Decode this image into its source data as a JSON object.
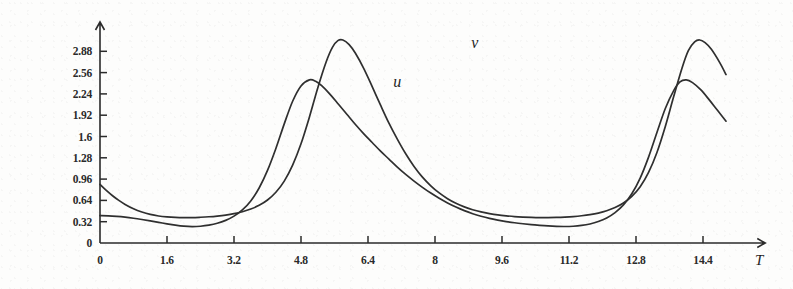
{
  "chart_data": {
    "type": "line",
    "title": "",
    "subtitle": "",
    "xlabel": "T",
    "ylabel": "",
    "xlim": [
      0,
      15.6
    ],
    "ylim": [
      0,
      3.2
    ],
    "grid": false,
    "legend_position": "inline-annotation",
    "x_ticks": [
      "0",
      "1.6",
      "3.2",
      "4.8",
      "6.4",
      "8",
      "9.6",
      "11.2",
      "12.8",
      "14.4"
    ],
    "x_tick_values": [
      0,
      1.6,
      3.2,
      4.8,
      6.4,
      8,
      9.6,
      11.2,
      12.8,
      14.4
    ],
    "y_ticks": [
      "0",
      "0.32",
      "0.64",
      "0.96",
      "1.28",
      "1.6",
      "1.92",
      "2.24",
      "2.56",
      "2.88"
    ],
    "y_tick_values": [
      0,
      0.32,
      0.64,
      0.96,
      1.28,
      1.6,
      1.92,
      2.24,
      2.56,
      2.88
    ],
    "annotations": [
      {
        "text": "u",
        "x": 7.1,
        "y": 2.34
      },
      {
        "text": "v",
        "x": 8.95,
        "y": 2.93
      }
    ],
    "series": [
      {
        "name": "u",
        "color": "#2f2f2f",
        "period": 4.72,
        "peak_value": 2.45,
        "trough_value": 0.25,
        "initial_value": 0.41,
        "peak_times": [
          2.85,
          7.57,
          12.29
        ],
        "points": [
          [
            0.0,
            0.41
          ],
          [
            0.2,
            0.408
          ],
          [
            0.4,
            0.4
          ],
          [
            0.6,
            0.388
          ],
          [
            0.8,
            0.372
          ],
          [
            1.0,
            0.353
          ],
          [
            1.2,
            0.332
          ],
          [
            1.4,
            0.31
          ],
          [
            1.6,
            0.288
          ],
          [
            1.8,
            0.268
          ],
          [
            2.0,
            0.253
          ],
          [
            2.2,
            0.247
          ],
          [
            2.4,
            0.252
          ],
          [
            2.6,
            0.268
          ],
          [
            2.8,
            0.296
          ],
          [
            3.0,
            0.34
          ],
          [
            3.2,
            0.404
          ],
          [
            3.4,
            0.497
          ],
          [
            3.6,
            0.632
          ],
          [
            3.8,
            0.826
          ],
          [
            4.0,
            1.09
          ],
          [
            4.2,
            1.42
          ],
          [
            4.4,
            1.79
          ],
          [
            4.6,
            2.13
          ],
          [
            4.8,
            2.36
          ],
          [
            5.0,
            2.45
          ],
          [
            5.15,
            2.43
          ],
          [
            5.3,
            2.36
          ],
          [
            5.5,
            2.23
          ],
          [
            5.7,
            2.08
          ],
          [
            5.9,
            1.93
          ],
          [
            6.1,
            1.78
          ],
          [
            6.3,
            1.64
          ],
          [
            6.5,
            1.51
          ],
          [
            6.7,
            1.38
          ],
          [
            6.9,
            1.26
          ],
          [
            7.1,
            1.14
          ],
          [
            7.3,
            1.03
          ],
          [
            7.5,
            0.93
          ],
          [
            7.7,
            0.836
          ],
          [
            7.9,
            0.75
          ],
          [
            8.1,
            0.672
          ],
          [
            8.3,
            0.602
          ],
          [
            8.5,
            0.54
          ],
          [
            8.7,
            0.486
          ],
          [
            8.9,
            0.44
          ],
          [
            9.1,
            0.402
          ],
          [
            9.3,
            0.37
          ],
          [
            9.5,
            0.344
          ],
          [
            9.7,
            0.322
          ],
          [
            9.9,
            0.304
          ],
          [
            10.1,
            0.289
          ],
          [
            10.3,
            0.276
          ],
          [
            10.5,
            0.265
          ],
          [
            10.7,
            0.256
          ],
          [
            10.9,
            0.25
          ],
          [
            11.1,
            0.248
          ],
          [
            11.3,
            0.252
          ],
          [
            11.5,
            0.264
          ],
          [
            11.7,
            0.286
          ],
          [
            11.9,
            0.322
          ],
          [
            12.1,
            0.376
          ],
          [
            12.3,
            0.456
          ],
          [
            12.5,
            0.572
          ],
          [
            12.7,
            0.74
          ],
          [
            12.9,
            0.975
          ],
          [
            13.1,
            1.29
          ],
          [
            13.3,
            1.66
          ],
          [
            13.5,
            2.02
          ],
          [
            13.7,
            2.29
          ],
          [
            13.85,
            2.42
          ],
          [
            14.0,
            2.45
          ],
          [
            14.15,
            2.41
          ],
          [
            14.35,
            2.3
          ],
          [
            14.55,
            2.15
          ],
          [
            14.75,
            1.99
          ],
          [
            14.95,
            1.83
          ]
        ]
      },
      {
        "name": "v",
        "color": "#2f2f2f",
        "period": 4.72,
        "peak_value": 3.05,
        "trough_value": 0.38,
        "initial_value": 0.88,
        "peak_times": [
          3.52,
          8.24,
          12.96
        ],
        "points": [
          [
            0.0,
            0.88
          ],
          [
            0.15,
            0.79
          ],
          [
            0.3,
            0.71
          ],
          [
            0.45,
            0.64
          ],
          [
            0.6,
            0.58
          ],
          [
            0.8,
            0.515
          ],
          [
            1.0,
            0.466
          ],
          [
            1.2,
            0.43
          ],
          [
            1.4,
            0.406
          ],
          [
            1.6,
            0.392
          ],
          [
            1.8,
            0.384
          ],
          [
            2.0,
            0.381
          ],
          [
            2.2,
            0.382
          ],
          [
            2.4,
            0.387
          ],
          [
            2.6,
            0.394
          ],
          [
            2.8,
            0.405
          ],
          [
            3.0,
            0.42
          ],
          [
            3.2,
            0.441
          ],
          [
            3.4,
            0.47
          ],
          [
            3.6,
            0.51
          ],
          [
            3.8,
            0.566
          ],
          [
            4.0,
            0.646
          ],
          [
            4.2,
            0.762
          ],
          [
            4.4,
            0.93
          ],
          [
            4.6,
            1.17
          ],
          [
            4.8,
            1.49
          ],
          [
            5.0,
            1.89
          ],
          [
            5.2,
            2.33
          ],
          [
            5.4,
            2.72
          ],
          [
            5.55,
            2.94
          ],
          [
            5.68,
            3.04
          ],
          [
            5.8,
            3.05
          ],
          [
            5.95,
            2.98
          ],
          [
            6.1,
            2.85
          ],
          [
            6.3,
            2.62
          ],
          [
            6.5,
            2.35
          ],
          [
            6.7,
            2.07
          ],
          [
            6.9,
            1.8
          ],
          [
            7.1,
            1.56
          ],
          [
            7.3,
            1.34
          ],
          [
            7.5,
            1.15
          ],
          [
            7.7,
            0.99
          ],
          [
            7.9,
            0.86
          ],
          [
            8.1,
            0.752
          ],
          [
            8.3,
            0.666
          ],
          [
            8.5,
            0.597
          ],
          [
            8.7,
            0.543
          ],
          [
            8.9,
            0.5
          ],
          [
            9.1,
            0.467
          ],
          [
            9.3,
            0.442
          ],
          [
            9.5,
            0.422
          ],
          [
            9.7,
            0.408
          ],
          [
            9.9,
            0.397
          ],
          [
            10.1,
            0.39
          ],
          [
            10.3,
            0.385
          ],
          [
            10.5,
            0.382
          ],
          [
            10.7,
            0.382
          ],
          [
            10.9,
            0.384
          ],
          [
            11.1,
            0.389
          ],
          [
            11.3,
            0.397
          ],
          [
            11.5,
            0.409
          ],
          [
            11.7,
            0.426
          ],
          [
            11.9,
            0.45
          ],
          [
            12.1,
            0.484
          ],
          [
            12.3,
            0.532
          ],
          [
            12.5,
            0.6
          ],
          [
            12.7,
            0.7
          ],
          [
            12.9,
            0.845
          ],
          [
            13.1,
            1.06
          ],
          [
            13.3,
            1.36
          ],
          [
            13.5,
            1.75
          ],
          [
            13.7,
            2.2
          ],
          [
            13.9,
            2.63
          ],
          [
            14.05,
            2.89
          ],
          [
            14.2,
            3.02
          ],
          [
            14.32,
            3.05
          ],
          [
            14.45,
            3.01
          ],
          [
            14.6,
            2.91
          ],
          [
            14.8,
            2.71
          ],
          [
            14.95,
            2.53
          ]
        ]
      }
    ]
  },
  "axes": {
    "x_axis_name": "T",
    "y_axis_name": "",
    "origin_label": "0"
  }
}
